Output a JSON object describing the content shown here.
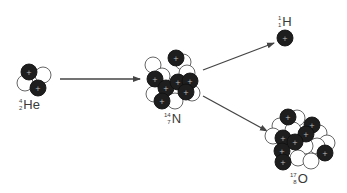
{
  "diagram": {
    "colors": {
      "proton": "#1e1e1e",
      "neutron": "#ffffff",
      "outline": "#555555",
      "arrow": "#444444",
      "plus": "#bdbdbd"
    },
    "nuclei": [
      {
        "id": "he4",
        "symbol": "He",
        "mass_number": "4",
        "atomic_number": "2",
        "protons": 2,
        "neutrons": 2,
        "label_pos": [
          19,
          96
        ],
        "particles": [
          {
            "type": "n",
            "x": 25,
            "y": 83
          },
          {
            "type": "n",
            "x": 43,
            "y": 75
          },
          {
            "type": "p",
            "x": 29,
            "y": 72
          },
          {
            "type": "p",
            "x": 38,
            "y": 88
          }
        ]
      },
      {
        "id": "n14",
        "symbol": "N",
        "mass_number": "14",
        "atomic_number": "7",
        "protons": 7,
        "neutrons": 7,
        "label_pos": [
          164,
          110
        ],
        "particles": [
          {
            "type": "n",
            "x": 153,
            "y": 65
          },
          {
            "type": "n",
            "x": 183,
            "y": 62
          },
          {
            "type": "n",
            "x": 187,
            "y": 73
          },
          {
            "type": "n",
            "x": 154,
            "y": 94
          },
          {
            "type": "n",
            "x": 192,
            "y": 93
          },
          {
            "type": "n",
            "x": 175,
            "y": 101
          },
          {
            "type": "n",
            "x": 162,
            "y": 76
          },
          {
            "type": "p",
            "x": 176,
            "y": 58
          },
          {
            "type": "p",
            "x": 155,
            "y": 79
          },
          {
            "type": "p",
            "x": 166,
            "y": 88
          },
          {
            "type": "p",
            "x": 178,
            "y": 82
          },
          {
            "type": "p",
            "x": 190,
            "y": 81
          },
          {
            "type": "p",
            "x": 186,
            "y": 92
          },
          {
            "type": "p",
            "x": 162,
            "y": 101
          }
        ]
      },
      {
        "id": "h1",
        "symbol": "H",
        "mass_number": "1",
        "atomic_number": "1",
        "protons": 1,
        "neutrons": 0,
        "label_pos": [
          278,
          13
        ],
        "particles": [
          {
            "type": "p",
            "x": 285,
            "y": 38
          }
        ]
      },
      {
        "id": "o17",
        "symbol": "O",
        "mass_number": "17",
        "atomic_number": "8",
        "protons": 8,
        "neutrons": 9,
        "label_pos": [
          290,
          170
        ],
        "particles": [
          {
            "type": "n",
            "x": 297,
            "y": 118
          },
          {
            "type": "n",
            "x": 280,
            "y": 126
          },
          {
            "type": "n",
            "x": 273,
            "y": 136
          },
          {
            "type": "n",
            "x": 293,
            "y": 130
          },
          {
            "type": "n",
            "x": 319,
            "y": 133
          },
          {
            "type": "n",
            "x": 327,
            "y": 143
          },
          {
            "type": "n",
            "x": 317,
            "y": 146
          },
          {
            "type": "n",
            "x": 305,
            "y": 146
          },
          {
            "type": "n",
            "x": 298,
            "y": 158
          },
          {
            "type": "n",
            "x": 311,
            "y": 161
          },
          {
            "type": "p",
            "x": 288,
            "y": 117
          },
          {
            "type": "p",
            "x": 312,
            "y": 125
          },
          {
            "type": "p",
            "x": 306,
            "y": 134
          },
          {
            "type": "p",
            "x": 283,
            "y": 138
          },
          {
            "type": "p",
            "x": 295,
            "y": 142
          },
          {
            "type": "p",
            "x": 282,
            "y": 151
          },
          {
            "type": "p",
            "x": 325,
            "y": 153
          },
          {
            "type": "p",
            "x": 283,
            "y": 162
          }
        ]
      }
    ],
    "arrows": [
      {
        "id": "he-to-n",
        "x1": 60,
        "y1": 79,
        "x2": 140,
        "y2": 79
      },
      {
        "id": "n-to-h",
        "x1": 203,
        "y1": 70,
        "x2": 274,
        "y2": 43
      },
      {
        "id": "n-to-o",
        "x1": 203,
        "y1": 96,
        "x2": 267,
        "y2": 131
      }
    ],
    "particle_radius": 8,
    "plus_sign": "+"
  }
}
